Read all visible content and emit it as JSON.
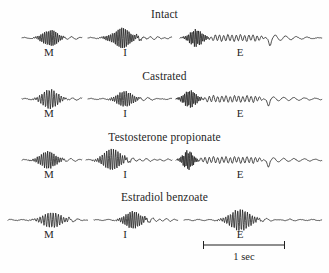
{
  "figure": {
    "background_color": "#fefefe",
    "trace_color": "#1f1f1f",
    "width": 329,
    "height": 273
  },
  "chart_data": {
    "type": "line",
    "title": "",
    "xlabel": "",
    "ylabel": "",
    "scalebar": {
      "label": "1 sec",
      "x_start": 203,
      "x_end": 285
    },
    "segment_labels": [
      "M",
      "I",
      "E"
    ],
    "panels": [
      {
        "title": "Intact",
        "title_y": 8,
        "baseline_y": 38,
        "label_y": 46,
        "traces": [
          {
            "label": "M",
            "label_x": 49,
            "x_start": 22,
            "x_end": 82,
            "burst_center": 50,
            "burst_width": 20,
            "amplitude": 9,
            "frequency": 34,
            "tail": "flat"
          },
          {
            "label": "I",
            "label_x": 125,
            "x_start": 88,
            "x_end": 172,
            "burst_center": 122,
            "burst_width": 26,
            "amplitude": 10,
            "frequency": 34,
            "tail": "ripple"
          },
          {
            "label": "E",
            "label_x": 240,
            "x_start": 180,
            "x_end": 322,
            "burst_center": 196,
            "burst_width": 18,
            "amplitude": 9,
            "frequency": 38,
            "tail": "oscillation-with-spike"
          }
        ]
      },
      {
        "title": "Castrated",
        "title_y": 70,
        "baseline_y": 99,
        "label_y": 107,
        "traces": [
          {
            "label": "M",
            "label_x": 49,
            "x_start": 22,
            "x_end": 82,
            "burst_center": 50,
            "burst_width": 22,
            "amplitude": 10,
            "frequency": 26,
            "tail": "flat"
          },
          {
            "label": "I",
            "label_x": 125,
            "x_start": 88,
            "x_end": 172,
            "burst_center": 125,
            "burst_width": 22,
            "amplitude": 8,
            "frequency": 30,
            "tail": "flat"
          },
          {
            "label": "E",
            "label_x": 240,
            "x_start": 176,
            "x_end": 322,
            "burst_center": 190,
            "burst_width": 18,
            "amplitude": 9,
            "frequency": 38,
            "tail": "oscillation-with-spike"
          }
        ]
      },
      {
        "title": "Testosterone propionate",
        "title_y": 131,
        "baseline_y": 160,
        "label_y": 168,
        "traces": [
          {
            "label": "M",
            "label_x": 49,
            "x_start": 22,
            "x_end": 82,
            "burst_center": 48,
            "burst_width": 22,
            "amplitude": 9,
            "frequency": 30,
            "tail": "flat"
          },
          {
            "label": "I",
            "label_x": 125,
            "x_start": 86,
            "x_end": 172,
            "burst_center": 112,
            "burst_width": 24,
            "amplitude": 11,
            "frequency": 28,
            "tail": "ripple"
          },
          {
            "label": "E",
            "label_x": 240,
            "x_start": 176,
            "x_end": 322,
            "burst_center": 188,
            "burst_width": 14,
            "amplitude": 10,
            "frequency": 42,
            "tail": "oscillation-with-spike"
          }
        ]
      },
      {
        "title": "Estradiol benzoate",
        "title_y": 191,
        "baseline_y": 220,
        "label_y": 228,
        "traces": [
          {
            "label": "M",
            "label_x": 49,
            "x_start": 8,
            "x_end": 88,
            "burst_center": 52,
            "burst_width": 26,
            "amplitude": 8,
            "frequency": 24,
            "tail": "flat"
          },
          {
            "label": "I",
            "label_x": 125,
            "x_start": 94,
            "x_end": 178,
            "burst_center": 133,
            "burst_width": 22,
            "amplitude": 9,
            "frequency": 30,
            "tail": "ripple"
          },
          {
            "label": "E",
            "label_x": 240,
            "x_start": 184,
            "x_end": 322,
            "burst_center": 240,
            "burst_width": 28,
            "amplitude": 11,
            "frequency": 26,
            "tail": "flat"
          }
        ]
      }
    ]
  }
}
